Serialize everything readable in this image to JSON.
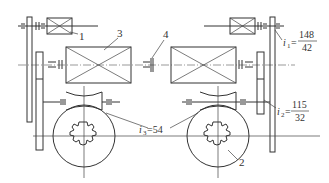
{
  "diagram": {
    "type": "mechanical transmission schematic",
    "labels": {
      "part1": "1",
      "part2": "2",
      "part3": "3",
      "part4": "4"
    },
    "ratios": {
      "i1": {
        "symbol": "i",
        "sub": "1",
        "eq": "=",
        "num": "148",
        "den": "42"
      },
      "i2": {
        "symbol": "i",
        "sub": "2",
        "eq": "=",
        "num": "115",
        "den": "32"
      },
      "i3": {
        "symbol": "i",
        "sub": "3",
        "text": "=54"
      }
    },
    "colors": {
      "line": "#333333",
      "background": "#ffffff"
    }
  }
}
